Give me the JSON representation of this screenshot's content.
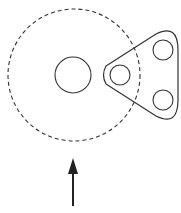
{
  "diagram": {
    "colors": {
      "background": "#ffffff",
      "stroke": "#333333"
    },
    "dashed_circle": {
      "cx": 74,
      "cy": 75,
      "r": 66
    },
    "center_circle": {
      "cx": 73,
      "cy": 75,
      "r": 18
    },
    "link_plate": {
      "holes": [
        {
          "cx": 120,
          "cy": 75,
          "r": 10
        },
        {
          "cx": 163,
          "cy": 50,
          "r": 10
        },
        {
          "cx": 163,
          "cy": 100,
          "r": 10
        }
      ]
    },
    "arrow": {
      "x": 73,
      "tip_y": 158,
      "tail_y": 206,
      "direction": "up"
    }
  }
}
